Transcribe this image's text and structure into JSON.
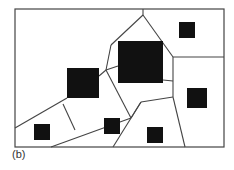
{
  "caption": "(b)",
  "colors": {
    "line": "#444444",
    "fill": "#111111",
    "background": "#ffffff"
  },
  "frame": {
    "x": 15,
    "y": 9,
    "w": 209,
    "h": 138
  },
  "squares": [
    {
      "id": "large-top",
      "x": 118,
      "y": 41,
      "w": 45,
      "h": 42
    },
    {
      "id": "large-left",
      "x": 67,
      "y": 68,
      "w": 32,
      "h": 30
    },
    {
      "id": "small-top-right",
      "x": 179,
      "y": 22,
      "w": 16,
      "h": 16
    },
    {
      "id": "small-right",
      "x": 187,
      "y": 88,
      "w": 20,
      "h": 20
    },
    {
      "id": "small-bottom-left",
      "x": 34,
      "y": 124,
      "w": 16,
      "h": 16
    },
    {
      "id": "small-middle",
      "x": 104,
      "y": 118,
      "w": 16,
      "h": 16
    },
    {
      "id": "small-bottom",
      "x": 147,
      "y": 127,
      "w": 16,
      "h": 16
    }
  ],
  "edges": [
    [
      143,
      9,
      143,
      15
    ],
    [
      143,
      15,
      111,
      45
    ],
    [
      143,
      15,
      173,
      57
    ],
    [
      111,
      45,
      106,
      70
    ],
    [
      106,
      70,
      99,
      76
    ],
    [
      106,
      70,
      118,
      66
    ],
    [
      106,
      70,
      131,
      118
    ],
    [
      173,
      57,
      224,
      57
    ],
    [
      173,
      57,
      173,
      97
    ],
    [
      163,
      80,
      173,
      81
    ],
    [
      173,
      97,
      185,
      147
    ],
    [
      173,
      97,
      141,
      102
    ],
    [
      141,
      102,
      131,
      118
    ],
    [
      141,
      102,
      113,
      147
    ],
    [
      67,
      98,
      15,
      128
    ],
    [
      63,
      104,
      75,
      130
    ],
    [
      131,
      118,
      51,
      147
    ]
  ]
}
